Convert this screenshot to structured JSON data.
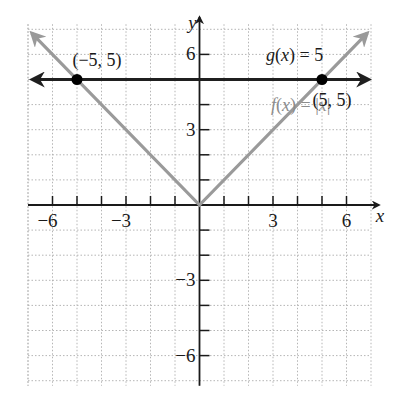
{
  "chart_data": {
    "type": "line",
    "title": "",
    "xlabel": "x",
    "ylabel": "y",
    "xlim": [
      -7,
      7
    ],
    "ylim": [
      -7.2,
      7.2
    ],
    "grid": true,
    "x_ticks": [
      -6,
      -5,
      -4,
      -3,
      -2,
      -1,
      1,
      2,
      3,
      4,
      5,
      6
    ],
    "y_ticks": [
      -6,
      -5,
      -4,
      -3,
      -2,
      -1,
      1,
      2,
      3,
      4,
      5,
      6
    ],
    "x_tick_labels": [
      {
        "value": -6,
        "label": "−6"
      },
      {
        "value": -3,
        "label": "−3"
      },
      {
        "value": 3,
        "label": "3"
      },
      {
        "value": 6,
        "label": "6"
      }
    ],
    "y_tick_labels": [
      {
        "value": 6,
        "label": "6"
      },
      {
        "value": 3,
        "label": "3"
      },
      {
        "value": -3,
        "label": "−3"
      },
      {
        "value": -6,
        "label": "−6"
      }
    ],
    "series": [
      {
        "name": "f(x) = |x|",
        "color": "#9a9a9a",
        "x": [
          -7,
          0,
          7
        ],
        "y": [
          7,
          0,
          7
        ],
        "label_at": [
          3,
          4
        ]
      },
      {
        "name": "g(x) = 5",
        "color": "#1f1f1f",
        "x": [
          -7,
          7
        ],
        "y": [
          5,
          5
        ],
        "label_at": [
          2.8,
          5.8
        ]
      }
    ],
    "points": [
      {
        "x": -5,
        "y": 5,
        "label": "(−5, 5)",
        "label_pos": "above-right"
      },
      {
        "x": 5,
        "y": 5,
        "label": "(5, 5)",
        "label_pos": "below"
      }
    ],
    "colors": {
      "axis": "#1a1a1a",
      "grid": "#b5b5b5",
      "f_line": "#9a9a9a",
      "g_line": "#1f1f1f",
      "point": "#000000"
    }
  }
}
